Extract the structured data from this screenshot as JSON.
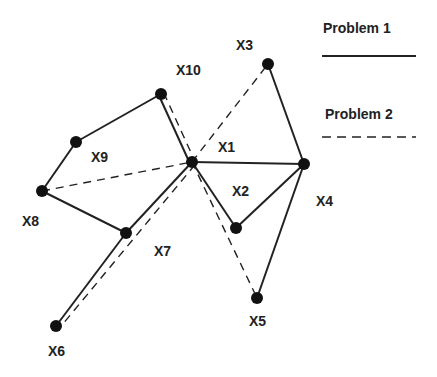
{
  "diagram": {
    "type": "graph",
    "colors": {
      "line": "#222222",
      "node": "#111111",
      "background": "#ffffff"
    },
    "nodes": [
      {
        "id": "X1",
        "label": "X1",
        "x": 192,
        "y": 162,
        "lx": 218,
        "ly": 152
      },
      {
        "id": "X2",
        "label": "X2",
        "x": 236,
        "y": 228,
        "lx": 232,
        "ly": 196
      },
      {
        "id": "X3",
        "label": "X3",
        "x": 268,
        "y": 64,
        "lx": 236,
        "ly": 50
      },
      {
        "id": "X4",
        "label": "X4",
        "x": 304,
        "y": 164,
        "lx": 316,
        "ly": 206
      },
      {
        "id": "X5",
        "label": "X5",
        "x": 257,
        "y": 298,
        "lx": 249,
        "ly": 326
      },
      {
        "id": "X6",
        "label": "X6",
        "x": 56,
        "y": 326,
        "lx": 48,
        "ly": 356
      },
      {
        "id": "X7",
        "label": "X7",
        "x": 126,
        "y": 233,
        "lx": 154,
        "ly": 256
      },
      {
        "id": "X8",
        "label": "X8",
        "x": 42,
        "y": 191,
        "lx": 22,
        "ly": 226
      },
      {
        "id": "X9",
        "label": "X9",
        "x": 76,
        "y": 142,
        "lx": 91,
        "ly": 162
      },
      {
        "id": "X10",
        "label": "X10",
        "x": 161,
        "y": 94,
        "lx": 176,
        "ly": 75
      }
    ],
    "edges_problem1": [
      [
        "X10",
        "X9"
      ],
      [
        "X9",
        "X8"
      ],
      [
        "X8",
        "X7"
      ],
      [
        "X7",
        "X6"
      ],
      [
        "X7",
        "X1"
      ],
      [
        "X10",
        "X1"
      ],
      [
        "X1",
        "X4"
      ],
      [
        "X1",
        "X2"
      ],
      [
        "X3",
        "X4"
      ],
      [
        "X4",
        "X2"
      ],
      [
        "X4",
        "X5"
      ]
    ],
    "edges_problem2": [
      [
        "X10",
        "X1"
      ],
      [
        "X8",
        "X1"
      ],
      [
        "X1",
        "X3"
      ],
      [
        "X1",
        "X6"
      ],
      [
        "X1",
        "X5"
      ]
    ]
  },
  "legend": {
    "items": [
      {
        "label": "Problem 1",
        "style": "solid"
      },
      {
        "label": "Problem 2",
        "style": "dashed"
      }
    ]
  }
}
